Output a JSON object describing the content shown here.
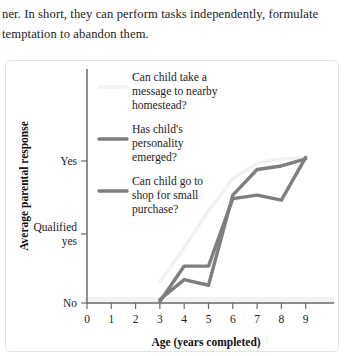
{
  "document": {
    "lines": [
      "ner. In short, they can perform tasks independently, formulate",
      "temptation to abandon them."
    ]
  },
  "chart_data": {
    "type": "line",
    "title": "",
    "xlabel": "Age (years completed)",
    "ylabel": "Average parental response",
    "grid": false,
    "legend_position": "inside-top-left",
    "x": [
      0,
      1,
      2,
      3,
      4,
      5,
      6,
      7,
      8,
      9
    ],
    "xlim": [
      0,
      9
    ],
    "xtick_labels": [
      "0",
      "1",
      "2",
      "3",
      "4",
      "5",
      "6",
      "7",
      "8",
      "9"
    ],
    "ytick_labels": [
      "No",
      "Qualified yes",
      "Yes"
    ],
    "ytick_values": [
      0,
      1,
      2
    ],
    "ylim": [
      0,
      2.45
    ],
    "colors": {
      "series_1": "#f1f1f1",
      "series_2": "#7e7e7e",
      "series_3": "#7e7e7e",
      "axis": "#6b6b6b",
      "panel_border": "#e3e3e3",
      "text": "#1c1c1c"
    },
    "series": [
      {
        "name": "Can child take a message to nearby homestead?",
        "color": "#f1f1f1",
        "points": [
          {
            "x": 3.0,
            "y": 0.3
          },
          {
            "x": 4.0,
            "y": 0.78
          },
          {
            "x": 5.0,
            "y": 1.3
          },
          {
            "x": 6.0,
            "y": 1.75
          },
          {
            "x": 7.0,
            "y": 1.97
          },
          {
            "x": 8.0,
            "y": 2.03
          },
          {
            "x": 9.0,
            "y": 2.05
          }
        ]
      },
      {
        "name": "Has child's personality emerged?",
        "color": "#7e7e7e",
        "points": [
          {
            "x": 3.0,
            "y": 0.02
          },
          {
            "x": 4.0,
            "y": 0.52
          },
          {
            "x": 5.0,
            "y": 0.52
          },
          {
            "x": 6.0,
            "y": 1.47
          },
          {
            "x": 7.0,
            "y": 1.52
          },
          {
            "x": 8.0,
            "y": 1.45
          },
          {
            "x": 9.0,
            "y": 2.05
          }
        ]
      },
      {
        "name": "Can child go to shop for small purchase?",
        "color": "#7e7e7e",
        "points": [
          {
            "x": 3.0,
            "y": 0.05
          },
          {
            "x": 4.0,
            "y": 0.33
          },
          {
            "x": 5.0,
            "y": 0.25
          },
          {
            "x": 6.0,
            "y": 1.52
          },
          {
            "x": 7.0,
            "y": 1.88
          },
          {
            "x": 8.0,
            "y": 1.93
          },
          {
            "x": 9.0,
            "y": 2.03
          }
        ]
      }
    ],
    "legend": [
      {
        "swatch_color": "#f1f1f1",
        "lines": [
          "Can child take a",
          "message to nearby",
          "homestead?"
        ]
      },
      {
        "swatch_color": "#7e7e7e",
        "lines": [
          "Has child's",
          "personality",
          "emerged?"
        ]
      },
      {
        "swatch_color": "#7e7e7e",
        "lines": [
          "Can child go to",
          "shop for small",
          "purchase?"
        ]
      }
    ]
  }
}
